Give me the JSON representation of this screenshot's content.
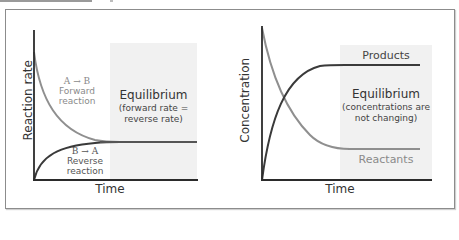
{
  "left_chart": {
    "y_label": "Reaction rate",
    "x_label": "Time",
    "forward": {
      "equation": "A → B",
      "line1": "Forward",
      "line2": "reaction"
    },
    "reverse": {
      "equation": "B → A",
      "line1": "Reverse",
      "line2": "reaction"
    },
    "equilibrium": {
      "title": "Equilibrium",
      "line1": "(forward rate =",
      "line2": "reverse rate)"
    }
  },
  "right_chart": {
    "y_label": "Concentration",
    "x_label": "Time",
    "products_label": "Products",
    "reactants_label": "Reactants",
    "equilibrium": {
      "title": "Equilibrium",
      "line1": "(concentrations are",
      "line2": "not changing)"
    }
  },
  "colors": {
    "dark_curve": "#3a3a3a",
    "light_curve": "#8f8f8f",
    "shade": "#f1f1f1",
    "axis": "#2b2b2b",
    "text": "#333333",
    "muted_text": "#8a8a8a"
  }
}
